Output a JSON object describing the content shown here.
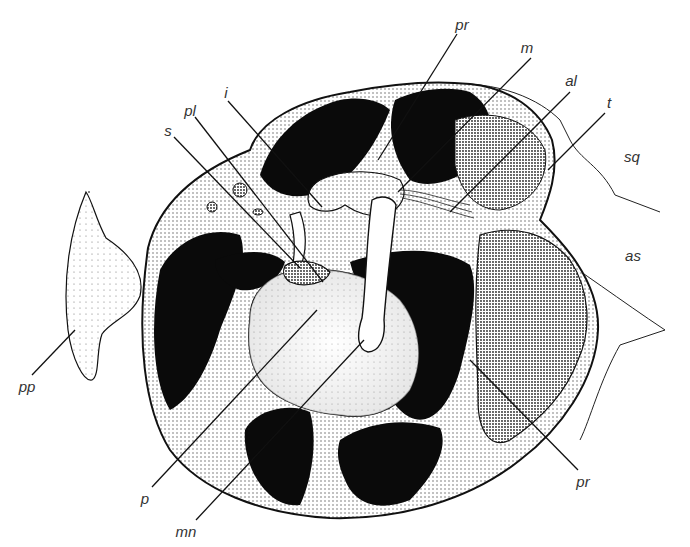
{
  "figure": {
    "type": "anatomical-illustration",
    "colors": {
      "background": "#ffffff",
      "ink": "#111111",
      "label": "#333333",
      "stipple": "#555555"
    }
  },
  "labels": [
    {
      "id": "pr-top",
      "text": "pr",
      "x": 462,
      "y": 24,
      "line": [
        457,
        34,
        378,
        160
      ]
    },
    {
      "id": "m",
      "text": "m",
      "x": 527,
      "y": 47,
      "line": [
        531,
        58,
        398,
        192
      ]
    },
    {
      "id": "al",
      "text": "al",
      "x": 571,
      "y": 80,
      "line": [
        570,
        92,
        450,
        212
      ]
    },
    {
      "id": "t",
      "text": "t",
      "x": 609,
      "y": 102,
      "line": [
        605,
        113,
        548,
        170
      ]
    },
    {
      "id": "sq",
      "text": "sq",
      "x": 632,
      "y": 156,
      "line": null
    },
    {
      "id": "as",
      "text": "as",
      "x": 633,
      "y": 255,
      "line": null
    },
    {
      "id": "i",
      "text": "i",
      "x": 226,
      "y": 92,
      "line": [
        228,
        101,
        322,
        207
      ]
    },
    {
      "id": "pl",
      "text": "pl",
      "x": 190,
      "y": 110,
      "line": [
        195,
        117,
        323,
        282
      ]
    },
    {
      "id": "s",
      "text": "s",
      "x": 168,
      "y": 130,
      "line": [
        174,
        137,
        300,
        268
      ]
    },
    {
      "id": "pp",
      "text": "pp",
      "x": 27,
      "y": 386,
      "line": [
        32,
        375,
        75,
        330
      ]
    },
    {
      "id": "p",
      "text": "p",
      "x": 145,
      "y": 498,
      "line": [
        152,
        487,
        317,
        310
      ]
    },
    {
      "id": "mn",
      "text": "mn",
      "x": 186,
      "y": 531,
      "line": [
        196,
        520,
        364,
        340
      ]
    },
    {
      "id": "pr-bottom",
      "text": "pr",
      "x": 583,
      "y": 481,
      "line": [
        578,
        470,
        470,
        360
      ]
    }
  ]
}
